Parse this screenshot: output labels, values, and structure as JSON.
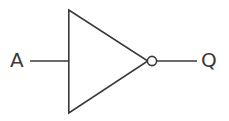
{
  "diagram": {
    "background_color": "#ffffff",
    "stroke_color": "#3a3a3a",
    "bubble_fill_color": "#ffffff",
    "stroke_width": 1.6,
    "width": 229,
    "height": 121,
    "gate": {
      "type": "NOT",
      "name": "inverter",
      "shape": "triangle-with-bubble",
      "triangle": {
        "points": "68,10 68,113 147,61",
        "top_left": {
          "x": 68,
          "y": 10
        },
        "bottom_left": {
          "x": 68,
          "y": 113
        },
        "apex": {
          "x": 147,
          "y": 61
        }
      },
      "bubble": {
        "cx": 152,
        "cy": 61,
        "r": 4.6
      }
    },
    "wires": [
      {
        "name": "input-wire",
        "from": {
          "x": 30,
          "y": 61
        },
        "to": {
          "x": 68,
          "y": 61
        }
      },
      {
        "name": "output-wire",
        "from": {
          "x": 157,
          "y": 61
        },
        "to": {
          "x": 197,
          "y": 61
        }
      }
    ],
    "labels": {
      "input": "A",
      "output": "Q"
    }
  }
}
